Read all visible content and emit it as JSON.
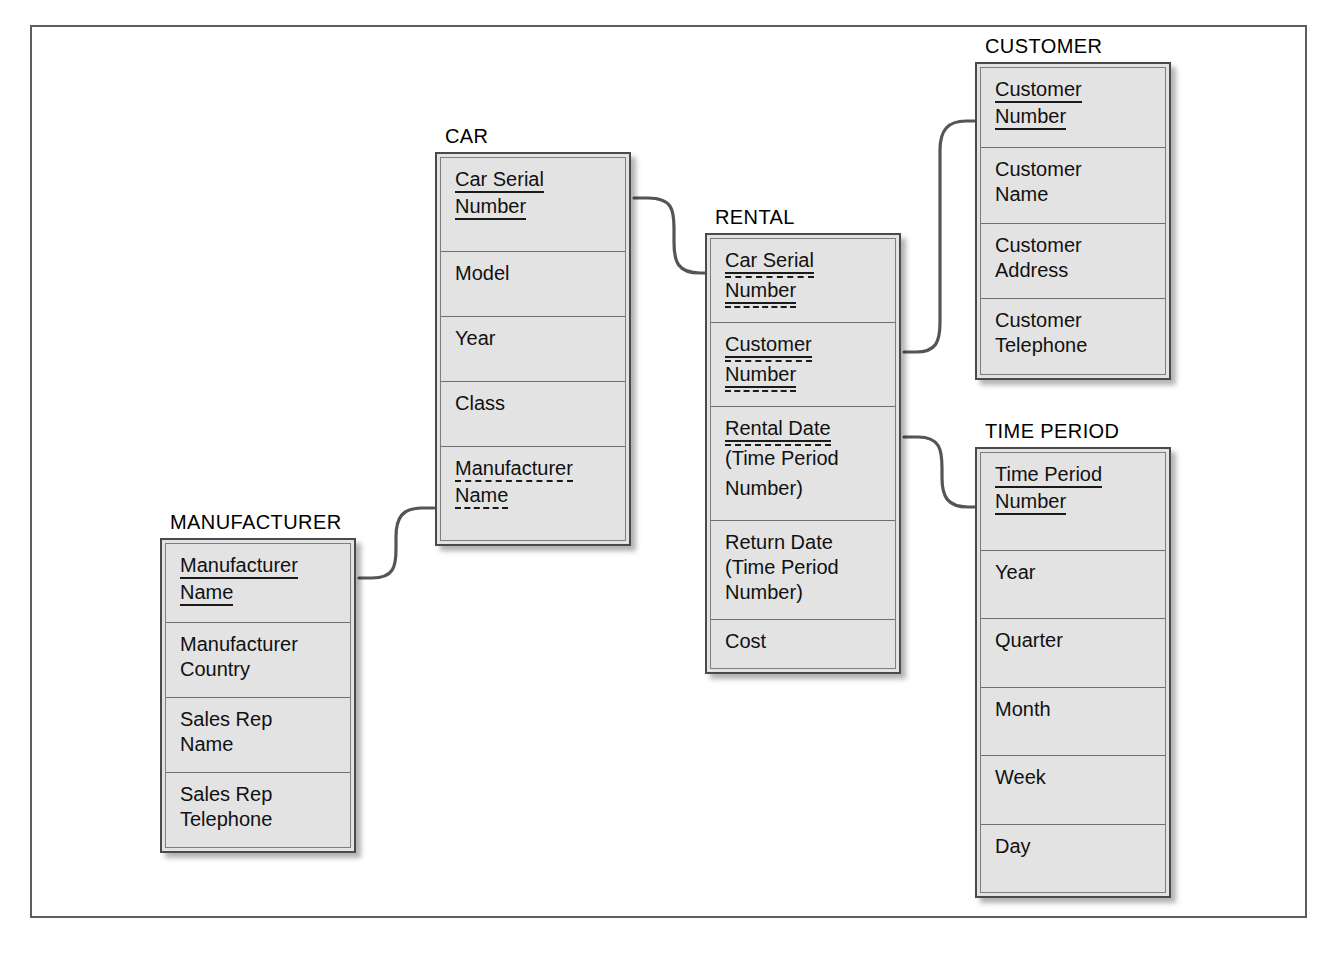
{
  "diagram": {
    "type": "entity-relationship-diagram",
    "notation": "relational schema with primary-key (solid underline) and foreign-key (dashed underline) markers",
    "entity_count": 5,
    "relationship_count": 4
  },
  "entities": [
    {
      "id": "car",
      "title": "CAR",
      "attributes": [
        {
          "lines": [
            "Car Serial",
            "Number"
          ],
          "key": "pk"
        },
        {
          "lines": [
            "Model"
          ],
          "key": "none"
        },
        {
          "lines": [
            "Year"
          ],
          "key": "none"
        },
        {
          "lines": [
            "Class"
          ],
          "key": "none"
        },
        {
          "lines": [
            "Manufacturer",
            "Name"
          ],
          "key": "fk"
        }
      ]
    },
    {
      "id": "rental",
      "title": "RENTAL",
      "attributes": [
        {
          "lines": [
            "Car Serial",
            "Number"
          ],
          "key": "pkfk"
        },
        {
          "lines": [
            "Customer",
            "Number"
          ],
          "key": "pkfk"
        },
        {
          "lines": [
            "Rental Date"
          ],
          "plain_lines": [
            "(Time Period",
            "Number)"
          ],
          "key": "pkfk"
        },
        {
          "lines": [
            "Return Date",
            "(Time Period",
            "Number)"
          ],
          "key": "none"
        },
        {
          "lines": [
            "Cost"
          ],
          "key": "none"
        }
      ]
    },
    {
      "id": "customer",
      "title": "CUSTOMER",
      "attributes": [
        {
          "lines": [
            "Customer",
            "Number"
          ],
          "key": "pk"
        },
        {
          "lines": [
            "Customer",
            "Name"
          ],
          "key": "none"
        },
        {
          "lines": [
            "Customer",
            "Address"
          ],
          "key": "none"
        },
        {
          "lines": [
            "Customer",
            "Telephone"
          ],
          "key": "none"
        }
      ]
    },
    {
      "id": "timeperiod",
      "title": "TIME PERIOD",
      "attributes": [
        {
          "lines": [
            "Time Period",
            "Number"
          ],
          "key": "pk"
        },
        {
          "lines": [
            "Year"
          ],
          "key": "none"
        },
        {
          "lines": [
            "Quarter"
          ],
          "key": "none"
        },
        {
          "lines": [
            "Month"
          ],
          "key": "none"
        },
        {
          "lines": [
            "Week"
          ],
          "key": "none"
        },
        {
          "lines": [
            "Day"
          ],
          "key": "none"
        }
      ]
    },
    {
      "id": "manufacturer",
      "title": "MANUFACTURER",
      "attributes": [
        {
          "lines": [
            "Manufacturer",
            "Name"
          ],
          "key": "pk"
        },
        {
          "lines": [
            "Manufacturer",
            "Country"
          ],
          "key": "none"
        },
        {
          "lines": [
            "Sales Rep",
            "Name"
          ],
          "key": "none"
        },
        {
          "lines": [
            "Sales Rep",
            "Telephone"
          ],
          "key": "none"
        }
      ]
    }
  ],
  "relationships": [
    {
      "id": "car-rental",
      "from": "CAR.Car Serial Number",
      "to": "RENTAL.Car Serial Number"
    },
    {
      "id": "rental-customer",
      "from": "RENTAL.Customer Number",
      "to": "CUSTOMER.Customer Number"
    },
    {
      "id": "rental-timeperiod",
      "from": "RENTAL.Rental Date",
      "to": "TIME PERIOD.Time Period Number"
    },
    {
      "id": "manufacturer-car",
      "from": "MANUFACTURER.Manufacturer Name",
      "to": "CAR.Manufacturer Name"
    }
  ],
  "colors": {
    "entity_fill": "#e3e3e3",
    "entity_border": "#4a4a4a",
    "row_divider": "#6f6f6f",
    "frame_border": "#5d5d5d",
    "connector": "#555555",
    "text": "#111111",
    "page_background": "#ffffff"
  }
}
